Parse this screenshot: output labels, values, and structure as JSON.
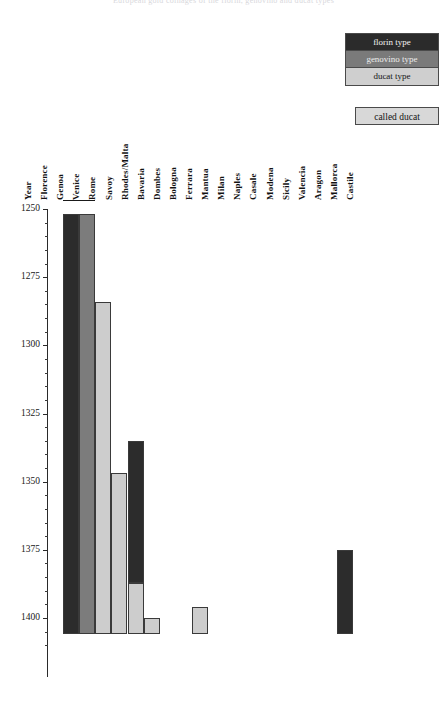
{
  "page": {
    "title_faint": "European gold coinages of the florin, genovino and ducat types"
  },
  "legend": {
    "types": [
      {
        "key": "florin",
        "label": "florin type",
        "color": "#2c2c2c"
      },
      {
        "key": "genovino",
        "label": "genovino type",
        "color": "#7c7c7c"
      },
      {
        "key": "ducat",
        "label": "ducat type",
        "color": "#cdcdcd"
      }
    ],
    "called_ducat_label": "called ducat"
  },
  "chart_data": {
    "type": "bar",
    "orientation": "vertical-timespan",
    "title": "",
    "subtitle": "",
    "xlabel": "",
    "ylabel": "",
    "ylim": [
      1245,
      1417
    ],
    "y_axis_inverted": true,
    "y_ticks_major": [
      1250,
      1275,
      1300,
      1325,
      1350,
      1375,
      1400
    ],
    "y_tick_minor_step": 5,
    "grid": false,
    "legend_position": "top-right",
    "categories": [
      "Year",
      "Florence",
      "Genoa",
      "Venice",
      "Rome",
      "Savoy",
      "Rhodes/Malta",
      "Bavaria",
      "Dombes",
      "Bologna",
      "Ferrara",
      "Mantua",
      "Milan",
      "Naples",
      "Casale",
      "Modena",
      "Sicily",
      "Valencia",
      "Aragon",
      "Mallorca",
      "Castile"
    ],
    "series": [
      {
        "name": "florin type",
        "color": "#2c2c2c",
        "spans": [
          {
            "category": "Florence",
            "start": 1252,
            "end": 1406
          },
          {
            "category": "Savoy",
            "start": 1335,
            "end": 1387
          },
          {
            "category": "Aragon",
            "start": 1375,
            "end": 1406
          }
        ]
      },
      {
        "name": "genovino type",
        "color": "#7c7c7c",
        "spans": [
          {
            "category": "Genoa",
            "start": 1252,
            "end": 1406
          }
        ]
      },
      {
        "name": "ducat type",
        "color": "#cdcdcd",
        "spans": [
          {
            "category": "Venice",
            "start": 1284,
            "end": 1406
          },
          {
            "category": "Rome",
            "start": 1347,
            "end": 1406
          },
          {
            "category": "Savoy",
            "start": 1387,
            "end": 1406
          },
          {
            "category": "Rhodes/Malta",
            "start": 1400,
            "end": 1406
          },
          {
            "category": "Bologna",
            "start": 1396,
            "end": 1406
          }
        ]
      }
    ]
  }
}
